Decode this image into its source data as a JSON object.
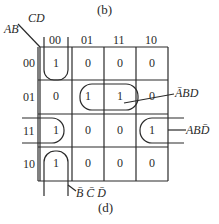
{
  "figure": {
    "top_caption": "(b)",
    "bottom_caption": "(d)"
  },
  "kmap": {
    "row_var": "AB",
    "col_var": "CD",
    "col_headers": [
      "00",
      "01",
      "11",
      "10"
    ],
    "row_headers": [
      "00",
      "01",
      "11",
      "10"
    ],
    "cells": [
      [
        "1",
        "0",
        "0",
        "0"
      ],
      [
        "0",
        "1",
        "1",
        "0"
      ],
      [
        "1",
        "0",
        "0",
        "1"
      ],
      [
        "1",
        "0",
        "0",
        "0"
      ]
    ],
    "groups": [
      {
        "label": "ĀBD",
        "cells": "row 01, cols 01-11"
      },
      {
        "label": "ABD̄",
        "cells": "row 11, cols 00 and 10 (wrap)"
      },
      {
        "label": "B̄ C̄ D̄",
        "cells": "col 00, rows 00 and 10 (wrap)"
      }
    ]
  },
  "labels": {
    "group1": "ĀBD",
    "group2": "ABD̄",
    "group3": "B̄ C̄ D̄"
  }
}
